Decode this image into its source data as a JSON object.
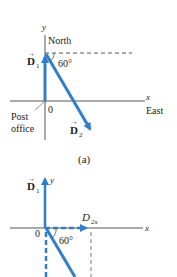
{
  "figure_a": {
    "y_axis_label": "y",
    "x_axis_label": "x",
    "north_label": "North",
    "east_label": "East",
    "origin_label": "0",
    "post_office_line1": "Post",
    "post_office_line2": "office",
    "angle_label": "60°",
    "vector1_label": "D",
    "vector1_sub": "1",
    "vector2_label": "D",
    "vector2_sub": "2",
    "caption": "(a)"
  },
  "figure_b": {
    "y_axis_label": "y",
    "x_axis_label": "x",
    "origin_label": "0",
    "angle_label": "60°",
    "vector1_label": "D",
    "vector1_sub": "1",
    "component_label": "D",
    "component_sub": "2x"
  },
  "colors": {
    "vector_blue": "#2f7fc8",
    "axis": "#555555",
    "dash": "#777777"
  }
}
